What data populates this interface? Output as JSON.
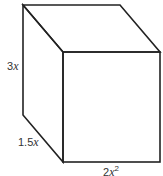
{
  "diagram": {
    "type": "rectangular-prism",
    "labels": {
      "height": {
        "coef": "3",
        "var": "x"
      },
      "depth": {
        "coef": "1.5",
        "var": "x"
      },
      "width": {
        "coef": "2",
        "var": "x",
        "exp": "2"
      }
    },
    "stroke_color": "#222222"
  }
}
